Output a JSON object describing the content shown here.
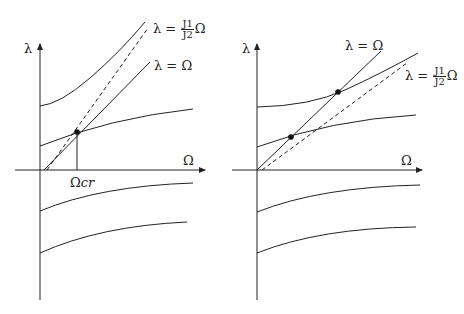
{
  "left_panel": {
    "y_axis_label": "λ",
    "x_axis_label": "Ω",
    "critical_label_prefix": "Ω",
    "critical_label_suffix": "cr",
    "line_label": "λ = Ω",
    "dashed_label_prefix": "λ =",
    "dashed_label_num": "J1",
    "dashed_label_den": "J2",
    "dashed_label_suffix": "Ω"
  },
  "right_panel": {
    "y_axis_label": "λ",
    "x_axis_label": "Ω",
    "line_label": "λ = Ω",
    "dashed_label_prefix": "λ =",
    "dashed_label_num": "J1",
    "dashed_label_den": "J2",
    "dashed_label_suffix": "Ω"
  },
  "colors": {
    "stroke": "#222222",
    "background": "#ffffff"
  }
}
